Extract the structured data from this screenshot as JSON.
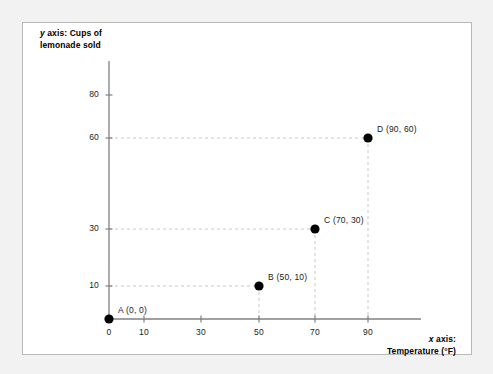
{
  "figure": {
    "y_axis_title": "y axis: Cups of\nlemonade sold",
    "y_axis_title_italic": "y",
    "y_axis_title_rest": " axis: Cups of\nlemonade sold",
    "x_axis_title_italic": "x",
    "x_axis_title_rest": " axis:\nTemperature (°F)",
    "background_color": "#f2f2f2",
    "card_color": "#ffffff",
    "card_border_color": "#b9b9b9",
    "axis_color": "#808080",
    "grid_color": "#c8c8c8",
    "marker_color": "#000000",
    "text_color": "#1a1a1a"
  },
  "chart_data": {
    "type": "scatter",
    "title": "",
    "xlabel": "x axis: Temperature (°F)",
    "ylabel": "y axis: Cups of lemonade sold",
    "xlim": [
      0,
      100
    ],
    "ylim": [
      0,
      85
    ],
    "grid": true,
    "legend": "none",
    "x_ticks": [
      0,
      10,
      30,
      50,
      70,
      90
    ],
    "x_tick_labels": [
      "0",
      "10",
      "30",
      "50",
      "70",
      "90"
    ],
    "y_ticks": [
      10,
      30,
      60,
      80
    ],
    "y_tick_labels": [
      "10",
      "30",
      "60",
      "80"
    ],
    "points": [
      {
        "name": "A",
        "x": 0,
        "y": 0,
        "label": "A (0, 0)"
      },
      {
        "name": "B",
        "x": 50,
        "y": 10,
        "label": "B (50, 10)"
      },
      {
        "name": "C",
        "x": 70,
        "y": 30,
        "label": "C (70, 30)"
      },
      {
        "name": "D",
        "x": 90,
        "y": 60,
        "label": "D (90, 60)"
      }
    ]
  }
}
